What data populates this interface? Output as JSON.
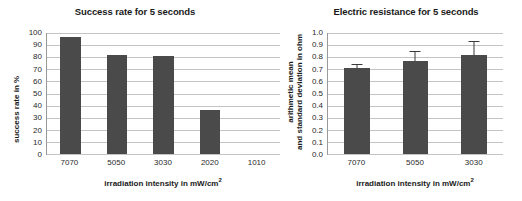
{
  "chart_data": [
    {
      "type": "bar",
      "id": "success-rate",
      "title": "Success rate for 5 seconds",
      "xlabel": "irradiation intensity in mW/cm²",
      "ylabel": "success rate in %",
      "categories": [
        "7070",
        "5050",
        "3030",
        "2020",
        "1010"
      ],
      "values": [
        97,
        81.5,
        81,
        36.5,
        null
      ],
      "ylim": [
        0,
        100
      ],
      "yticks": [
        "0",
        "10",
        "20",
        "30",
        "40",
        "50",
        "60",
        "70",
        "80",
        "90",
        "100"
      ],
      "ytick_values": [
        0,
        10,
        20,
        30,
        40,
        50,
        60,
        70,
        80,
        90,
        100
      ],
      "grid": true,
      "legend": "none",
      "bar_color": "#4a4a4a"
    },
    {
      "type": "bar",
      "id": "electric-resistance",
      "title": "Electric resistance for 5 seconds",
      "xlabel": "irradiation intensity in mW/cm²",
      "ylabel_line1": "arithmetic mean",
      "ylabel_line2": "and standard deviation in ohm",
      "categories": [
        "7070",
        "5050",
        "3030"
      ],
      "values": [
        0.71,
        0.77,
        0.815
      ],
      "errors": [
        0.03,
        0.08,
        0.115
      ],
      "ylim": [
        0.0,
        1.0
      ],
      "yticks": [
        "0.0",
        "0.1",
        "0.2",
        "0.3",
        "0.4",
        "0.5",
        "0.6",
        "0.7",
        "0.8",
        "0.9",
        "1.0"
      ],
      "ytick_values": [
        0.0,
        0.1,
        0.2,
        0.3,
        0.4,
        0.5,
        0.6,
        0.7,
        0.8,
        0.9,
        1.0
      ],
      "grid": true,
      "legend": "none",
      "bar_color": "#4a4a4a",
      "error_color": "#3a3a3a"
    }
  ]
}
